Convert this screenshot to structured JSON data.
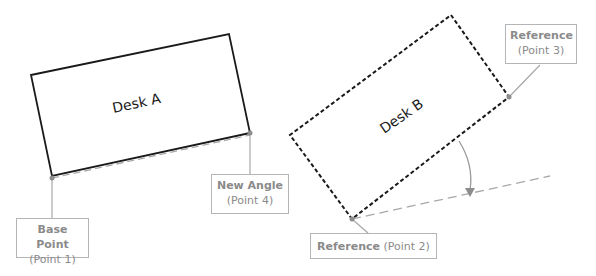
{
  "diagram": {
    "desks": [
      {
        "id": "desk-a",
        "label": "Desk A",
        "style": "solid",
        "rotation_deg": -12
      },
      {
        "id": "desk-b",
        "label": "Desk B",
        "style": "dashed",
        "rotation_deg": -35
      }
    ],
    "labels": {
      "base_point": {
        "title": "Base Point",
        "sub": "(Point 1)"
      },
      "new_angle": {
        "title": "New Angle",
        "sub": "(Point 4)"
      },
      "reference_2": {
        "title": "Reference",
        "sub": "(Point 2)"
      },
      "reference_3": {
        "title": "Reference",
        "sub": "(Point 3)"
      }
    },
    "colors": {
      "desk_stroke": "#1a1a1a",
      "guide_line": "#a0a0a0",
      "label_border": "#b5b5b5",
      "label_text": "#8a8a8a",
      "point_marker": "#8c8c8c"
    }
  }
}
